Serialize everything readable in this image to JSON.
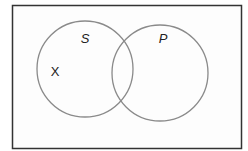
{
  "diagram": {
    "type": "venn",
    "universe": {
      "x": 12,
      "y": 5,
      "width": 230,
      "height": 144,
      "stroke": "#333333",
      "fill": "#fdfdfd"
    },
    "sets": [
      {
        "name": "S",
        "label": "S",
        "label_italic": true,
        "cx": 85,
        "cy": 69,
        "r": 48,
        "stroke": "#8a8a8a",
        "label_x": 85,
        "label_y": 43
      },
      {
        "name": "P",
        "label": "P",
        "label_italic": true,
        "cx": 160,
        "cy": 73,
        "r": 48,
        "stroke": "#8a8a8a",
        "label_x": 163,
        "label_y": 43
      }
    ],
    "marks": [
      {
        "label": "X",
        "region": "S only",
        "x": 55,
        "y": 76
      }
    ]
  }
}
